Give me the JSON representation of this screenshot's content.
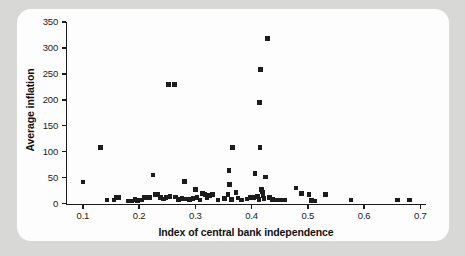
{
  "figure": {
    "panel_background": "#fdfdfd",
    "outer_background": "#d8d8d6",
    "marker_color": "#1c1c1c",
    "axis_color": "#1b1b1b"
  },
  "chart_data": {
    "type": "scatter",
    "title": "",
    "xlabel": "Index of central bank independence",
    "ylabel": "Average inflation",
    "xlim": [
      0.07,
      0.71
    ],
    "ylim": [
      0,
      350
    ],
    "xticks": [
      0.1,
      0.2,
      0.3,
      0.4,
      0.5,
      0.6,
      0.7
    ],
    "xtick_labels": [
      "0.1",
      "0.2",
      "0.3",
      "0.4",
      "0.5",
      "0.6",
      "0.7"
    ],
    "yticks": [
      0,
      50,
      100,
      150,
      200,
      250,
      300,
      350
    ],
    "ytick_labels": [
      "0",
      "50",
      "100",
      "150",
      "200",
      "250",
      "300",
      "350"
    ],
    "grid": false,
    "legend": null,
    "marker": "square",
    "points": [
      [
        0.1,
        42
      ],
      [
        0.131,
        108
      ],
      [
        0.143,
        7
      ],
      [
        0.155,
        7
      ],
      [
        0.16,
        12
      ],
      [
        0.163,
        12
      ],
      [
        0.181,
        5
      ],
      [
        0.187,
        5
      ],
      [
        0.193,
        8
      ],
      [
        0.197,
        6
      ],
      [
        0.205,
        7
      ],
      [
        0.21,
        12
      ],
      [
        0.218,
        12
      ],
      [
        0.225,
        55
      ],
      [
        0.228,
        17
      ],
      [
        0.233,
        18
      ],
      [
        0.238,
        12
      ],
      [
        0.243,
        9
      ],
      [
        0.248,
        12
      ],
      [
        0.252,
        230
      ],
      [
        0.255,
        14
      ],
      [
        0.263,
        230
      ],
      [
        0.265,
        13
      ],
      [
        0.27,
        8
      ],
      [
        0.276,
        10
      ],
      [
        0.281,
        43
      ],
      [
        0.284,
        9
      ],
      [
        0.29,
        8
      ],
      [
        0.296,
        10
      ],
      [
        0.3,
        27
      ],
      [
        0.303,
        12
      ],
      [
        0.308,
        7
      ],
      [
        0.313,
        19
      ],
      [
        0.317,
        18
      ],
      [
        0.321,
        12
      ],
      [
        0.325,
        16
      ],
      [
        0.33,
        17
      ],
      [
        0.34,
        7
      ],
      [
        0.352,
        10
      ],
      [
        0.358,
        17
      ],
      [
        0.36,
        64
      ],
      [
        0.361,
        37
      ],
      [
        0.364,
        8
      ],
      [
        0.366,
        108
      ],
      [
        0.372,
        21
      ],
      [
        0.376,
        11
      ],
      [
        0.382,
        7
      ],
      [
        0.392,
        9
      ],
      [
        0.398,
        12
      ],
      [
        0.403,
        12
      ],
      [
        0.406,
        58
      ],
      [
        0.41,
        14
      ],
      [
        0.413,
        8
      ],
      [
        0.414,
        195
      ],
      [
        0.415,
        108
      ],
      [
        0.416,
        258
      ],
      [
        0.418,
        27
      ],
      [
        0.419,
        22
      ],
      [
        0.42,
        16
      ],
      [
        0.422,
        10
      ],
      [
        0.425,
        51
      ],
      [
        0.428,
        318
      ],
      [
        0.432,
        12
      ],
      [
        0.437,
        8
      ],
      [
        0.445,
        7
      ],
      [
        0.452,
        7
      ],
      [
        0.458,
        7
      ],
      [
        0.479,
        30
      ],
      [
        0.489,
        20
      ],
      [
        0.502,
        18
      ],
      [
        0.506,
        6
      ],
      [
        0.512,
        5
      ],
      [
        0.531,
        17
      ],
      [
        0.577,
        7
      ],
      [
        0.659,
        7
      ],
      [
        0.681,
        7
      ]
    ]
  }
}
